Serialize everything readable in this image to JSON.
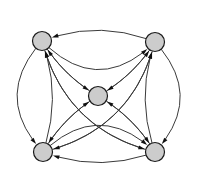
{
  "figure": {
    "type": "directed-graph",
    "width": 198,
    "height": 193,
    "background_color": "#ffffff"
  },
  "style": {
    "node_fill": "#cccccc",
    "node_stroke": "#1a1a1a",
    "node_stroke_width": 1.2,
    "node_radius": 9.5,
    "edge_stroke": "#3a3a3a",
    "edge_stroke_width": 1.0,
    "arrow_fill": "#101010",
    "arrow_length": 6.5,
    "arrow_width": 4.0
  },
  "graph": {
    "node_count": 5,
    "edge_count": 20,
    "directed": true,
    "nodes": [
      {
        "id": "n1",
        "label": "",
        "name": "node-top-left",
        "cx": 42,
        "cy": 41,
        "r": 9.5
      },
      {
        "id": "n2",
        "label": "",
        "name": "node-top-right",
        "cx": 155,
        "cy": 42,
        "r": 9.5
      },
      {
        "id": "n3",
        "label": "",
        "name": "node-center",
        "cx": 98,
        "cy": 96,
        "r": 9.5
      },
      {
        "id": "n4",
        "label": "",
        "name": "node-bottom-left",
        "cx": 43,
        "cy": 152,
        "r": 9.5
      },
      {
        "id": "n5",
        "label": "",
        "name": "node-bottom-right",
        "cx": 155,
        "cy": 152,
        "r": 9.5
      }
    ],
    "edges": [
      {
        "from": "n1",
        "to": "n2",
        "name": "edge-top-left-to-top-right"
      },
      {
        "from": "n2",
        "to": "n1",
        "name": "edge-top-right-to-top-left"
      },
      {
        "from": "n1",
        "to": "n4",
        "name": "edge-top-left-to-bottom-left"
      },
      {
        "from": "n4",
        "to": "n1",
        "name": "edge-bottom-left-to-top-left"
      },
      {
        "from": "n2",
        "to": "n5",
        "name": "edge-top-right-to-bottom-right"
      },
      {
        "from": "n5",
        "to": "n2",
        "name": "edge-bottom-right-to-top-right"
      },
      {
        "from": "n4",
        "to": "n5",
        "name": "edge-bottom-left-to-bottom-right"
      },
      {
        "from": "n5",
        "to": "n4",
        "name": "edge-bottom-right-to-bottom-left"
      },
      {
        "from": "n1",
        "to": "n5",
        "name": "edge-top-left-to-bottom-right"
      },
      {
        "from": "n5",
        "to": "n1",
        "name": "edge-bottom-right-to-top-left"
      },
      {
        "from": "n2",
        "to": "n4",
        "name": "edge-top-right-to-bottom-left"
      },
      {
        "from": "n4",
        "to": "n2",
        "name": "edge-bottom-left-to-top-right"
      },
      {
        "from": "n1",
        "to": "n3",
        "name": "edge-top-left-to-center"
      },
      {
        "from": "n3",
        "to": "n1",
        "name": "edge-center-to-top-left"
      },
      {
        "from": "n2",
        "to": "n3",
        "name": "edge-top-right-to-center"
      },
      {
        "from": "n3",
        "to": "n2",
        "name": "edge-center-to-top-right"
      },
      {
        "from": "n4",
        "to": "n3",
        "name": "edge-bottom-left-to-center"
      },
      {
        "from": "n3",
        "to": "n4",
        "name": "edge-center-to-bottom-left"
      },
      {
        "from": "n5",
        "to": "n3",
        "name": "edge-bottom-right-to-center"
      },
      {
        "from": "n3",
        "to": "n5",
        "name": "edge-center-to-bottom-right"
      }
    ]
  }
}
